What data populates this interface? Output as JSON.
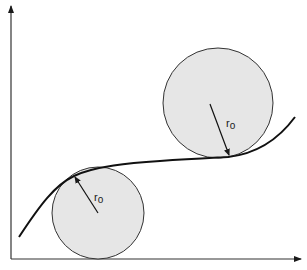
{
  "diagram": {
    "type": "curve with osculating circles",
    "axes": {
      "x_axis": {
        "label": ""
      },
      "y_axis": {
        "label": ""
      }
    },
    "curve": {
      "description": "S-shaped curve rising from lower-left, flattening, then rising to upper-right"
    },
    "circles": [
      {
        "id": "upper",
        "position": "above curve, tangent at right inflection region",
        "radius_label": "r0",
        "label_main": "r",
        "label_sub": "o"
      },
      {
        "id": "lower",
        "position": "below curve, tangent at left bend",
        "radius_label": "r0",
        "label_main": "r",
        "label_sub": "o"
      }
    ],
    "colors": {
      "circle_fill": "#e6e6e6",
      "stroke": "#1a1a1a",
      "background": "#ffffff"
    }
  }
}
